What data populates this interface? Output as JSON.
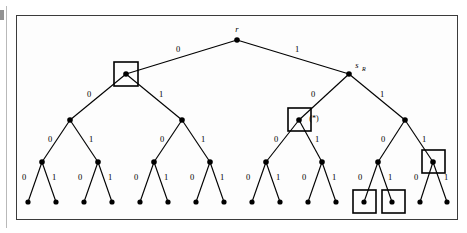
{
  "figure": {
    "type": "binary-tree-diagram",
    "depth": 4,
    "leaf_count": 16,
    "frame": {
      "x": 16,
      "y": 15,
      "width": 442,
      "height": 205
    }
  },
  "labels": {
    "root": "r",
    "right_child_main": "s",
    "right_child_subscript": "R",
    "starred": "(*)",
    "edge_zero": "0",
    "edge_one": "1"
  },
  "colors": {
    "ink": "#000000",
    "frame": "#3b3b3b",
    "paper": "#fdfdfd",
    "page_edge": "#b9b9b9"
  },
  "levels": [
    {
      "level": 0,
      "y": 40,
      "nodes": [
        {
          "id": "r",
          "x": 237
        }
      ]
    },
    {
      "level": 1,
      "y": 74,
      "nodes": [
        {
          "id": "n0",
          "x": 126
        },
        {
          "id": "n1",
          "x": 349
        }
      ]
    },
    {
      "level": 2,
      "y": 120,
      "nodes": [
        {
          "id": "n00",
          "x": 70
        },
        {
          "id": "n01",
          "x": 182
        },
        {
          "id": "n10",
          "x": 299
        },
        {
          "id": "n11",
          "x": 405
        }
      ]
    },
    {
      "level": 3,
      "y": 162,
      "nodes": [
        {
          "id": "n000",
          "x": 42
        },
        {
          "id": "n001",
          "x": 98
        },
        {
          "id": "n010",
          "x": 154
        },
        {
          "id": "n011",
          "x": 210
        },
        {
          "id": "n100",
          "x": 266
        },
        {
          "id": "n101",
          "x": 322
        },
        {
          "id": "n110",
          "x": 378
        },
        {
          "id": "n111",
          "x": 433
        }
      ]
    },
    {
      "level": 4,
      "y": 202,
      "nodes": [
        {
          "id": "l0",
          "x": 28
        },
        {
          "id": "l1",
          "x": 56
        },
        {
          "id": "l2",
          "x": 84
        },
        {
          "id": "l3",
          "x": 112
        },
        {
          "id": "l4",
          "x": 140
        },
        {
          "id": "l5",
          "x": 168
        },
        {
          "id": "l6",
          "x": 196
        },
        {
          "id": "l7",
          "x": 224
        },
        {
          "id": "l8",
          "x": 252
        },
        {
          "id": "l9",
          "x": 280
        },
        {
          "id": "l10",
          "x": 308
        },
        {
          "id": "l11",
          "x": 336
        },
        {
          "id": "l12",
          "x": 364
        },
        {
          "id": "l13",
          "x": 392
        },
        {
          "id": "l14",
          "x": 420
        },
        {
          "id": "l15",
          "x": 447
        }
      ]
    }
  ],
  "highlight_boxes": [
    {
      "name": "box-level1-left",
      "x": 114,
      "y": 62,
      "size": 24,
      "target": "n0"
    },
    {
      "name": "box-level2-starred",
      "x": 288,
      "y": 108,
      "size": 23,
      "target": "n10"
    },
    {
      "name": "box-level3-right",
      "x": 422,
      "y": 150,
      "size": 23,
      "target": "n111"
    },
    {
      "name": "box-leaf-left",
      "x": 353,
      "y": 190,
      "size": 23,
      "target": "l12"
    },
    {
      "name": "box-leaf-right",
      "x": 382,
      "y": 190,
      "size": 23,
      "target": "l13"
    }
  ],
  "node_labels": [
    {
      "name": "root-label",
      "text": "r",
      "x": 237,
      "y": 32,
      "style": "italic"
    },
    {
      "name": "sr-label",
      "text": "s",
      "x": 357,
      "y": 68,
      "style": "italic",
      "subscript": {
        "text": "R",
        "x": 362,
        "y": 71
      }
    },
    {
      "name": "starred-label",
      "text": "(*)",
      "x": 314,
      "y": 121,
      "style": "plain"
    }
  ],
  "edge_labels": [
    {
      "text": "0",
      "x": 178,
      "y": 52
    },
    {
      "text": "1",
      "x": 297,
      "y": 52
    },
    {
      "text": "0",
      "x": 89,
      "y": 97
    },
    {
      "text": "1",
      "x": 161,
      "y": 97
    },
    {
      "text": "0",
      "x": 313,
      "y": 97
    },
    {
      "text": "1",
      "x": 382,
      "y": 97
    },
    {
      "text": "0",
      "x": 50,
      "y": 142
    },
    {
      "text": "1",
      "x": 91,
      "y": 142
    },
    {
      "text": "0",
      "x": 162,
      "y": 142
    },
    {
      "text": "1",
      "x": 203,
      "y": 142
    },
    {
      "text": "0",
      "x": 276,
      "y": 142
    },
    {
      "text": "1",
      "x": 317,
      "y": 142
    },
    {
      "text": "0",
      "x": 383,
      "y": 142
    },
    {
      "text": "1",
      "x": 424,
      "y": 142
    },
    {
      "text": "0",
      "x": 24,
      "y": 180
    },
    {
      "text": "1",
      "x": 54,
      "y": 180
    },
    {
      "text": "0",
      "x": 80,
      "y": 180
    },
    {
      "text": "1",
      "x": 110,
      "y": 180
    },
    {
      "text": "0",
      "x": 136,
      "y": 180
    },
    {
      "text": "1",
      "x": 166,
      "y": 180
    },
    {
      "text": "0",
      "x": 192,
      "y": 180
    },
    {
      "text": "1",
      "x": 222,
      "y": 180
    },
    {
      "text": "0",
      "x": 248,
      "y": 180
    },
    {
      "text": "1",
      "x": 278,
      "y": 180
    },
    {
      "text": "0",
      "x": 304,
      "y": 180
    },
    {
      "text": "1",
      "x": 334,
      "y": 180
    },
    {
      "text": "0",
      "x": 360,
      "y": 180
    },
    {
      "text": "1",
      "x": 390,
      "y": 180
    },
    {
      "text": "0",
      "x": 416,
      "y": 180
    },
    {
      "text": "1",
      "x": 446,
      "y": 180
    }
  ]
}
